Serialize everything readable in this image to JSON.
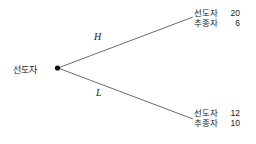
{
  "diagram": {
    "type": "game-tree",
    "background_color": "#ffffff",
    "line_color": "#5a5a5a",
    "text_color": "#1a1a1a",
    "root": {
      "label": "선도자",
      "node_marker": "filled-dot"
    },
    "branches": [
      {
        "id": "high",
        "label": "H",
        "direction": "up"
      },
      {
        "id": "low",
        "label": "L",
        "direction": "down"
      }
    ],
    "outcomes": [
      {
        "id": "high",
        "rows": [
          {
            "name": "선도자",
            "value": "20"
          },
          {
            "name": "추종자",
            "value": "6"
          }
        ]
      },
      {
        "id": "low",
        "rows": [
          {
            "name": "선도자",
            "value": "12"
          },
          {
            "name": "추종자",
            "value": "10"
          }
        ]
      }
    ]
  }
}
